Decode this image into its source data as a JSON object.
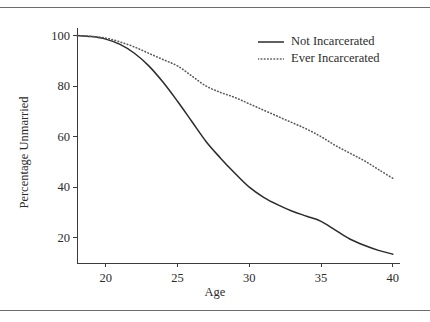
{
  "chart_data": {
    "type": "line",
    "title": "",
    "xlabel": "Age",
    "ylabel": "Percentage Unmarried",
    "xlim": [
      18,
      40.5
    ],
    "ylim": [
      10,
      103
    ],
    "grid": false,
    "legend_position": "top-right",
    "xticks": [
      20,
      25,
      30,
      35,
      40
    ],
    "yticks": [
      20,
      40,
      60,
      80,
      100
    ],
    "x": [
      18,
      19,
      20,
      21,
      22,
      23,
      24,
      25,
      26,
      27,
      28,
      29,
      30,
      31,
      32,
      33,
      34,
      35,
      36,
      37,
      38,
      39,
      40
    ],
    "series": [
      {
        "name": "Not Incarcerated",
        "style": "solid",
        "color": "#2b2b2b",
        "values": [
          100,
          99.6,
          98.6,
          96.5,
          93,
          88,
          81.5,
          74,
          66,
          58,
          51.5,
          45.5,
          40,
          36,
          33,
          30.5,
          28.5,
          26.5,
          23,
          19.5,
          17,
          15,
          13.5
        ]
      },
      {
        "name": "Ever Incarcerated",
        "style": "dotted",
        "color": "#5a5a5a",
        "values": [
          100,
          99.7,
          99,
          97.5,
          95.5,
          93,
          90.5,
          88,
          84,
          80,
          77.5,
          75.5,
          73,
          70.5,
          68,
          65.5,
          63,
          60,
          56.5,
          53.5,
          50.5,
          47,
          43.5
        ]
      }
    ]
  },
  "legend": {
    "entries": [
      {
        "label": "Not Incarcerated",
        "sample": "solid-line-sample"
      },
      {
        "label": "Ever Incarcerated",
        "sample": "dotted-line-sample"
      }
    ]
  },
  "axes": {
    "x_title": "Age",
    "y_title": "Percentage Unmarried",
    "x_tick_labels": [
      "20",
      "25",
      "30",
      "35",
      "40"
    ],
    "y_tick_labels": [
      "20",
      "40",
      "60",
      "80",
      "100"
    ]
  }
}
